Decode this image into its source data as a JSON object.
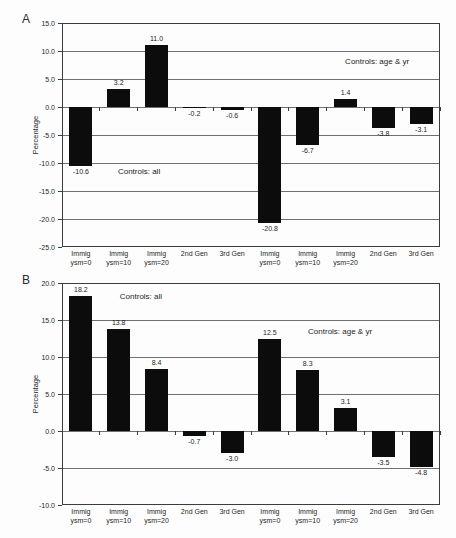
{
  "figure": {
    "background": "#fdfdfd",
    "bar_color": "#0c0c0c",
    "text_color": "#1d1d1d"
  },
  "chart_data": [
    {
      "type": "bar",
      "panel_label": "A",
      "title": "",
      "xlabel": "",
      "ylabel": "Percentage",
      "ylim": [
        -25,
        15
      ],
      "ytick_step": 5,
      "grid": true,
      "legend": "none",
      "categories": [
        [
          "Immig",
          "ysm=0"
        ],
        [
          "Immig",
          "ysm=10"
        ],
        [
          "Immig",
          "ysm=20"
        ],
        [
          "2nd Gen"
        ],
        [
          "3rd Gen"
        ],
        [
          "Immig",
          "ysm=0"
        ],
        [
          "Immig",
          "ysm=10"
        ],
        [
          "Immig",
          "ysm=20"
        ],
        [
          "2nd Gen"
        ],
        [
          "3rd Gen"
        ]
      ],
      "values": [
        -10.6,
        3.2,
        11.0,
        -0.2,
        -0.6,
        -20.8,
        -6.7,
        1.4,
        -3.8,
        -3.1
      ],
      "annotations": [
        {
          "text": "Controls: all",
          "x_pct": 14.8,
          "y_pct": 64.3
        },
        {
          "text": "Controls: age & yr",
          "x_pct": 74.9,
          "y_pct": 15.0
        }
      ]
    },
    {
      "type": "bar",
      "panel_label": "B",
      "title": "",
      "xlabel": "",
      "ylabel": "Percentage",
      "ylim": [
        -10,
        20
      ],
      "ytick_step": 5,
      "grid": true,
      "legend": "none",
      "categories": [
        [
          "Immig",
          "ysm=0"
        ],
        [
          "Immig",
          "ysm=10"
        ],
        [
          "Immig",
          "ysm=20"
        ],
        [
          "2nd Gen"
        ],
        [
          "3rd Gen"
        ],
        [
          "Immig",
          "ysm=0"
        ],
        [
          "Immig",
          "ysm=10"
        ],
        [
          "Immig",
          "ysm=20"
        ],
        [
          "2nd Gen"
        ],
        [
          "3rd Gen"
        ]
      ],
      "values": [
        18.2,
        13.8,
        8.4,
        -0.7,
        -3.0,
        12.5,
        8.3,
        3.1,
        -3.5,
        -4.8
      ],
      "annotations": [
        {
          "text": "Controls: all",
          "x_pct": 15.3,
          "y_pct": 4.1
        },
        {
          "text": "Controls: age & yr",
          "x_pct": 65.1,
          "y_pct": 19.8
        }
      ]
    }
  ]
}
